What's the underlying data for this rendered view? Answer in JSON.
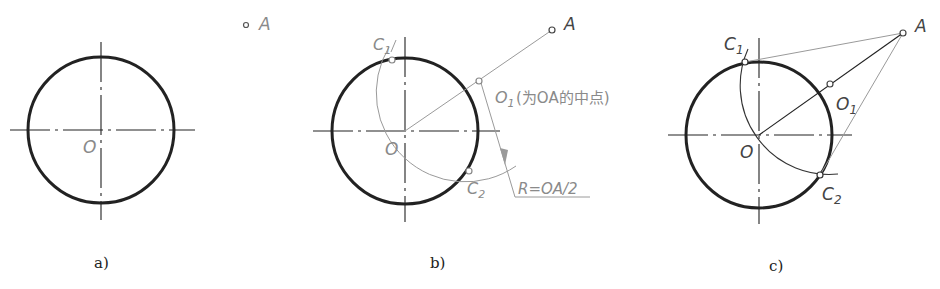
{
  "figure": {
    "colors": {
      "circle": "#222222",
      "construction_light": "#9a9a9a",
      "construction_dark": "#333333",
      "text_light": "#8a8a8a",
      "text_dark": "#444444"
    },
    "panels": [
      {
        "id": "a",
        "caption": "a)",
        "center_label": "O",
        "point_label": "A"
      },
      {
        "id": "b",
        "caption": "b)",
        "center_label": "O",
        "point_label": "A",
        "midpoint_label": "O",
        "midpoint_sub": "1",
        "midpoint_note": "(为OA的中点)",
        "tangent_point_1": "C",
        "tangent_point_1_sub": "1",
        "tangent_point_2": "C",
        "tangent_point_2_sub": "2",
        "radius_note": "R=OA/2"
      },
      {
        "id": "c",
        "caption": "c)",
        "center_label": "O",
        "point_label": "A",
        "midpoint_label": "O",
        "midpoint_sub": "1",
        "tangent_point_1": "C",
        "tangent_point_1_sub": "1",
        "tangent_point_2": "C",
        "tangent_point_2_sub": "2"
      }
    ]
  }
}
